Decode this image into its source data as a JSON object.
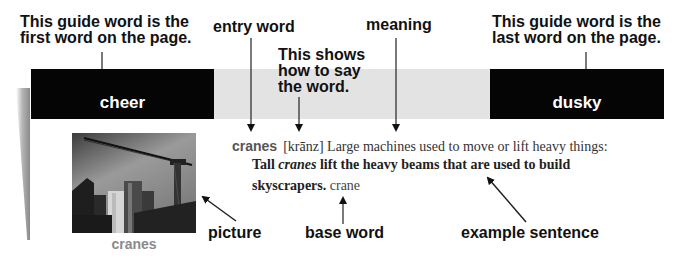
{
  "callouts": {
    "first_guide": [
      "This guide word is the",
      "first word on the page."
    ],
    "entry_word": "entry word",
    "pronunciation": [
      "This shows",
      "how to say",
      "the word."
    ],
    "meaning": "meaning",
    "last_guide": [
      "This guide word is the",
      "last word on the page."
    ],
    "picture": "picture",
    "base_word": "base word",
    "example_sentence": "example sentence"
  },
  "guide_words": {
    "first": "cheer",
    "last": "dusky"
  },
  "entry": {
    "headword": "cranes",
    "pronunciation": "[krānz]",
    "definition": "Large machines used to move or lift heavy things:",
    "example_pre": "Tall ",
    "example_italic": "cranes",
    "example_line1_post": " lift the heavy beams that are used to build",
    "example_line2": "skyscrapers.",
    "base_word": " crane"
  },
  "picture": {
    "alt": "cranes over skyscrapers photo",
    "caption": "cranes"
  },
  "colors": {
    "guide_box": "#050505",
    "band": "#e3e3e3",
    "caption": "#8a8a8a"
  }
}
